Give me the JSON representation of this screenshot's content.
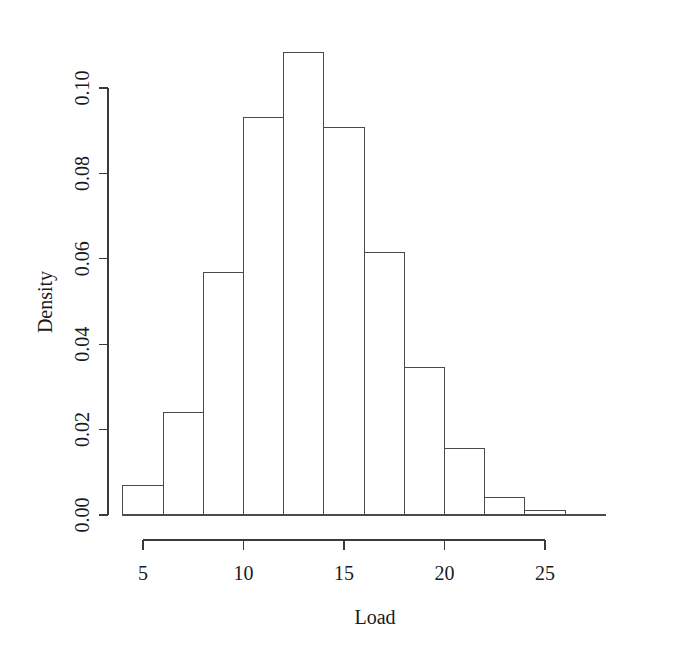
{
  "chart_data": {
    "type": "bar",
    "title": "",
    "xlabel": "Load",
    "ylabel": "Density",
    "grid": false,
    "legend": null,
    "bin_width": 2,
    "bin_edges": [
      4,
      6,
      8,
      10,
      12,
      14,
      16,
      18,
      20,
      22,
      24,
      26,
      28
    ],
    "categories": [
      "4-6",
      "6-8",
      "8-10",
      "10-12",
      "12-14",
      "14-16",
      "16-18",
      "18-20",
      "20-22",
      "22-24",
      "24-26",
      "26-28"
    ],
    "x": [
      5,
      7,
      9,
      11,
      13,
      15,
      17,
      19,
      21,
      23,
      25,
      27
    ],
    "values": [
      0.007,
      0.0239,
      0.0569,
      0.093,
      0.1083,
      0.0908,
      0.0615,
      0.0345,
      0.0155,
      0.0042,
      0.001,
      0.0002
    ],
    "xlim": [
      4,
      28
    ],
    "ylim": [
      0,
      0.1083
    ],
    "xticks": [
      5,
      10,
      15,
      20,
      25
    ],
    "xtick_labels": [
      "5",
      "10",
      "15",
      "20",
      "25"
    ],
    "yticks": [
      0.0,
      0.02,
      0.04,
      0.06,
      0.08,
      0.1
    ],
    "ytick_labels": [
      "0.00",
      "0.02",
      "0.04",
      "0.06",
      "0.08",
      "0.10"
    ],
    "axis_color": "#3a3a3a",
    "bar_fill": "#ffffff",
    "bar_stroke": "#4a4a4a",
    "background": "#ffffff"
  }
}
